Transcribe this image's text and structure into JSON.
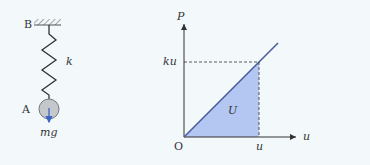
{
  "spring_diagram": {
    "support_label": "B",
    "spring_label": "k",
    "mass_label": "A",
    "force_label": "mg"
  },
  "graph": {
    "y_axis_label": "P",
    "x_axis_label": "u",
    "origin_label": "O",
    "y_marker_label": "ku",
    "x_marker_label": "u",
    "area_label": "U"
  },
  "colors": {
    "background": "#f3f8fb",
    "line": "#4a5f9e",
    "area_fill": "#a8bdf0",
    "arrow_blue": "#3a66c4",
    "mass_fill": "#c4c8cc"
  }
}
